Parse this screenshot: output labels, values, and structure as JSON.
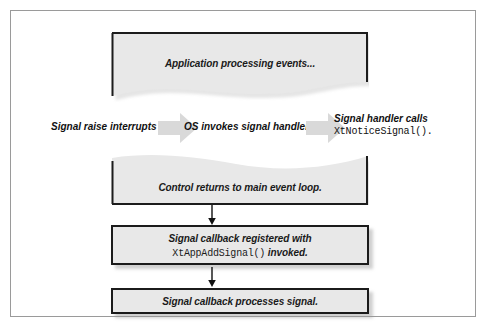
{
  "diagram": {
    "title_text": "Signal handling flow",
    "colors": {
      "box_fill": "#e8e8e8",
      "box_border": "#1b1b1b",
      "arrow_fill": "#d9d9d9",
      "frame_border": "#9a9a9a",
      "text": "#1a1a1a"
    },
    "boxes": [
      {
        "name": "application-processing",
        "label": "Application processing events...",
        "shape": "torn-bottom"
      },
      {
        "name": "control-returns",
        "label": "Control returns to main event loop.",
        "shape": "torn-top"
      },
      {
        "name": "callback-registered",
        "line1": "Signal callback registered with",
        "line2_code": "XtAppAddSignal()",
        "line2_tail": " invoked.",
        "shape": "rect"
      },
      {
        "name": "callback-processes",
        "label": "Signal callback processes signal.",
        "shape": "rect"
      }
    ],
    "chain": {
      "step1_label": "Signal raise interrupts",
      "step2_label": "OS invokes signal handler",
      "step3_label": "Signal handler calls",
      "step3_code": "XtNoticeSignal().",
      "arrow_1_name": "block-arrow-right",
      "arrow_2_name": "block-arrow-right"
    },
    "connectors": [
      {
        "name": "arrow-control-to-callback",
        "direction": "down"
      },
      {
        "name": "arrow-callback-to-processes",
        "direction": "down"
      }
    ]
  }
}
